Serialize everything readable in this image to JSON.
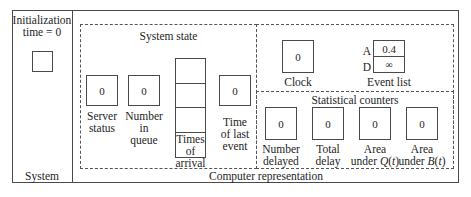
{
  "system_panel": {
    "title_line1": "Initialization",
    "title_line2": "time = 0",
    "footer": "System"
  },
  "computer_panel": {
    "footer": "Computer representation",
    "system_state": {
      "title": "System state",
      "server_status": {
        "value": "0",
        "label_line1": "Server",
        "label_line2": "status"
      },
      "number_in_queue": {
        "value": "0",
        "label_line1": "Number",
        "label_line2": "in",
        "label_line3": "queue"
      },
      "times_of_arrival": {
        "rows": 4,
        "label_line1": "Times",
        "label_line2": "of",
        "label_line3": "arrival"
      },
      "time_of_last_event": {
        "value": "0",
        "label_line1": "Time",
        "label_line2": "of last",
        "label_line3": "event"
      }
    },
    "clock": {
      "value": "0",
      "label": "Clock"
    },
    "event_list": {
      "label": "Event list",
      "rows": [
        {
          "key": "A",
          "value": "0.4"
        },
        {
          "key": "D",
          "value": "∞"
        }
      ]
    },
    "statistical_counters": {
      "title": "Statistical counters",
      "number_delayed": {
        "value": "0",
        "label_line1": "Number",
        "label_line2": "delayed"
      },
      "total_delay": {
        "value": "0",
        "label_line1": "Total",
        "label_line2": "delay"
      },
      "area_under_q": {
        "value": "0",
        "label_line1": "Area",
        "label_line2_prefix": "under ",
        "label_line2_func": "Q",
        "label_line2_arg": "t"
      },
      "area_under_b": {
        "value": "0",
        "label_line1": "Area",
        "label_line2_prefix": "under ",
        "label_line2_func": "B",
        "label_line2_arg": "t"
      }
    }
  }
}
